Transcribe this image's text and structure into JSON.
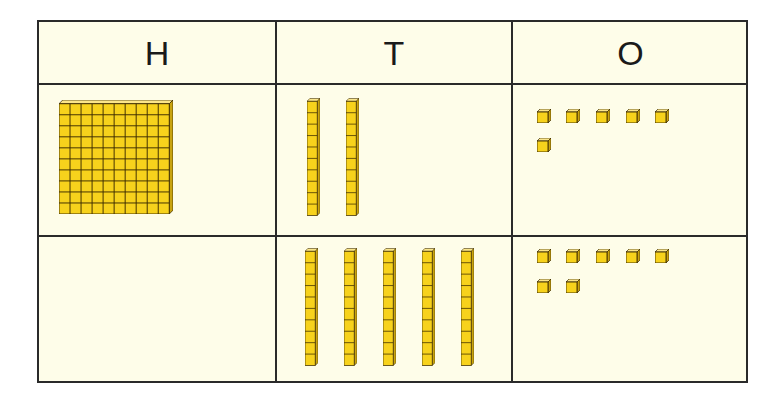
{
  "headers": [
    "H",
    "T",
    "O"
  ],
  "rows": [
    {
      "hundreds": 1,
      "tens": 2,
      "ones": 6
    },
    {
      "hundreds": 0,
      "tens": 5,
      "ones": 7
    }
  ],
  "colors": {
    "background": "#fefde9",
    "border": "#2a2a2a",
    "block_fill": "#f7d21c",
    "block_edge": "#3a2a00",
    "block_top": "#fbe68a"
  }
}
